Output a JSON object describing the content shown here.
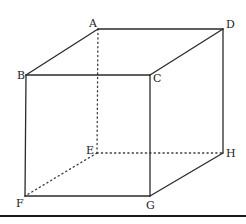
{
  "figure": {
    "type": "cube",
    "vertices": [
      {
        "label": "A",
        "x": 98,
        "y": 29,
        "lx": 93,
        "ly": 27,
        "anchor": "middle"
      },
      {
        "label": "D",
        "x": 223,
        "y": 29,
        "lx": 226,
        "ly": 28,
        "anchor": "start"
      },
      {
        "label": "B",
        "x": 26,
        "y": 75,
        "lx": 17,
        "ly": 79,
        "anchor": "start"
      },
      {
        "label": "C",
        "x": 150,
        "y": 75,
        "lx": 153,
        "ly": 82,
        "anchor": "start"
      },
      {
        "label": "E",
        "x": 97,
        "y": 153,
        "lx": 86,
        "ly": 154,
        "anchor": "start"
      },
      {
        "label": "H",
        "x": 223,
        "y": 153,
        "lx": 226,
        "ly": 157,
        "anchor": "start"
      },
      {
        "label": "F",
        "x": 25,
        "y": 196,
        "lx": 16,
        "ly": 207,
        "anchor": "start"
      },
      {
        "label": "G",
        "x": 150,
        "y": 196,
        "lx": 146,
        "ly": 209,
        "anchor": "start"
      }
    ],
    "solid_edges": [
      [
        "A",
        "D"
      ],
      [
        "A",
        "B"
      ],
      [
        "B",
        "C"
      ],
      [
        "C",
        "D"
      ],
      [
        "B",
        "F"
      ],
      [
        "C",
        "G"
      ],
      [
        "D",
        "H"
      ],
      [
        "F",
        "G"
      ],
      [
        "G",
        "H"
      ]
    ],
    "hidden_edges": [
      [
        "A",
        "E"
      ],
      [
        "E",
        "F"
      ],
      [
        "E",
        "H"
      ]
    ],
    "colors": {
      "line": "#2a2a2a",
      "background": "#ffffff"
    }
  },
  "baseline_rule": {
    "y": 216,
    "x1": 0,
    "x2": 246
  }
}
